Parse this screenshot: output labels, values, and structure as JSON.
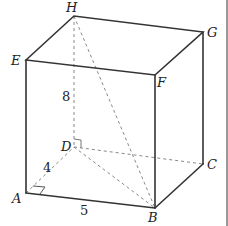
{
  "figure": {
    "type": "rectangular prism",
    "vertices": {
      "A": {
        "label": "A"
      },
      "B": {
        "label": "B"
      },
      "C": {
        "label": "C"
      },
      "D": {
        "label": "D"
      },
      "E": {
        "label": "E"
      },
      "F": {
        "label": "F"
      },
      "G": {
        "label": "G"
      },
      "H": {
        "label": "H"
      }
    },
    "dimensions": {
      "AD": "4",
      "AB": "5",
      "DH": "8"
    },
    "diagonal": "HB",
    "right_angles": [
      "A",
      "D"
    ]
  }
}
